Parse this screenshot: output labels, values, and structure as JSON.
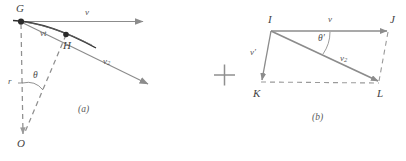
{
  "figure": {
    "plus_sign": "+",
    "colors": {
      "line_gray": "#8c8c8c",
      "line_dark": "#3a3a3a",
      "dash_gray": "#9a9a9a",
      "text": "#4a4a4a",
      "background": "#ffffff"
    },
    "panels": [
      {
        "id": "a",
        "caption": "(a)",
        "vertices": [
          {
            "name": "G",
            "label": "G"
          },
          {
            "name": "H",
            "label": "H"
          },
          {
            "name": "O",
            "label": "O"
          }
        ],
        "labels": [
          {
            "name": "velocity-v",
            "text": "v"
          },
          {
            "name": "arc-length-vt",
            "text": "vt"
          },
          {
            "name": "velocity-v2",
            "text": "v",
            "subscript": "2"
          },
          {
            "name": "radius-r",
            "text": "r"
          },
          {
            "name": "angle-theta",
            "text": "θ"
          }
        ]
      },
      {
        "id": "b",
        "caption": "(b)",
        "vertices": [
          {
            "name": "I",
            "label": "I"
          },
          {
            "name": "J",
            "label": "J"
          },
          {
            "name": "K",
            "label": "K"
          },
          {
            "name": "L",
            "label": "L"
          }
        ],
        "labels": [
          {
            "name": "velocity-v",
            "text": "v"
          },
          {
            "name": "velocity-v-prime",
            "text": "v′"
          },
          {
            "name": "velocity-v2",
            "text": "v",
            "subscript": "2"
          },
          {
            "name": "angle-theta-prime",
            "text": "θ′"
          }
        ]
      }
    ]
  }
}
